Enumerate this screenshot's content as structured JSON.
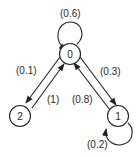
{
  "diagram": {
    "type": "markov-chain-state-diagram",
    "nodes": [
      {
        "id": "0",
        "label": "0"
      },
      {
        "id": "1",
        "label": "1"
      },
      {
        "id": "2",
        "label": "2"
      }
    ],
    "edges": [
      {
        "from": "0",
        "to": "0",
        "label": "(0.6)",
        "probability": 0.6
      },
      {
        "from": "0",
        "to": "2",
        "label": "(0.1)",
        "probability": 0.1
      },
      {
        "from": "2",
        "to": "0",
        "label": "(1)",
        "probability": 1
      },
      {
        "from": "0",
        "to": "1",
        "label": "(0.3)",
        "probability": 0.3
      },
      {
        "from": "1",
        "to": "0",
        "label": "(0.8)",
        "probability": 0.8
      },
      {
        "from": "1",
        "to": "1",
        "label": "(0.2)",
        "probability": 0.2
      }
    ],
    "colors": {
      "stroke": "#222222",
      "text": "#2a2a2a",
      "background": "#ffffff"
    }
  }
}
